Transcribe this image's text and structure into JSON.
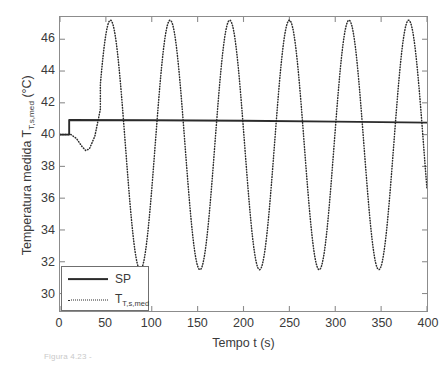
{
  "figure": {
    "background_color": "#ffffff",
    "axis_color": "#8c8c8c",
    "series_color": "#2b2b2b",
    "caption_fragment": "Figura 4.23 -"
  },
  "legend": {
    "position": "lower-left",
    "entries": [
      {
        "label": "SP",
        "style": "solid"
      },
      {
        "label": "T",
        "sublabel": "T,s,med",
        "style": "dotted"
      }
    ]
  },
  "chart_data": {
    "type": "line",
    "title": "",
    "xlabel": "Tempo t (s)",
    "ylabel_main": "Temperatura medida T",
    "ylabel_sub": "T,s,med",
    "ylabel_unit": " (°C)",
    "ylabel_full": "Temperatura medida T_{T,s,med} (°C)",
    "xlim": [
      0,
      400
    ],
    "ylim": [
      28.9,
      47.4
    ],
    "xticks": [
      0,
      50,
      100,
      150,
      200,
      250,
      300,
      350,
      400
    ],
    "xticklabels": [
      "0",
      "50",
      "100",
      "150",
      "200",
      "250",
      "300",
      "350",
      "400"
    ],
    "yticks": [
      30,
      32,
      34,
      36,
      38,
      40,
      42,
      44,
      46
    ],
    "yticklabels": [
      "30",
      "32",
      "34",
      "36",
      "38",
      "40",
      "42",
      "44",
      "46"
    ],
    "grid": false,
    "series": [
      {
        "name": "SP",
        "style": "solid",
        "description": "Setpoint: constant 40 until t=10 s, step to 40.9, then essentially flat with very slight downward drift to 40.75 at t=400",
        "points": [
          [
            0,
            40.0
          ],
          [
            10,
            40.0
          ],
          [
            10,
            40.92
          ],
          [
            100,
            40.9
          ],
          [
            200,
            40.87
          ],
          [
            300,
            40.82
          ],
          [
            400,
            40.75
          ]
        ]
      },
      {
        "name": "T_T,s,med",
        "style": "dotted",
        "description": "Measured temperature: initial undershoot to 39.0 near t=28, then sustained oscillation of period about 65 s between 31.5 and 47.2",
        "initial_transient": [
          [
            0,
            40.0
          ],
          [
            12,
            40.0
          ],
          [
            18,
            39.75
          ],
          [
            24,
            39.25
          ],
          [
            28,
            39.0
          ],
          [
            32,
            39.1
          ],
          [
            38,
            39.9
          ],
          [
            44,
            41.6
          ]
        ],
        "oscillation": {
          "period_s": 65,
          "peak_value": 47.2,
          "trough_value": 31.5,
          "mean_value": 39.35,
          "amplitude": 7.85,
          "first_peak_t": 55,
          "peak_times": [
            55,
            120,
            185,
            251,
            317,
            382
          ],
          "trough_times": [
            88,
            152,
            218,
            283,
            350
          ],
          "peak_values": [
            47.15,
            47.25,
            47.2,
            47.25,
            47.2,
            47.1
          ],
          "trough_values": [
            31.6,
            31.5,
            31.5,
            31.55,
            31.45
          ],
          "end_t": 400,
          "end_value": 37.6
        }
      }
    ]
  }
}
